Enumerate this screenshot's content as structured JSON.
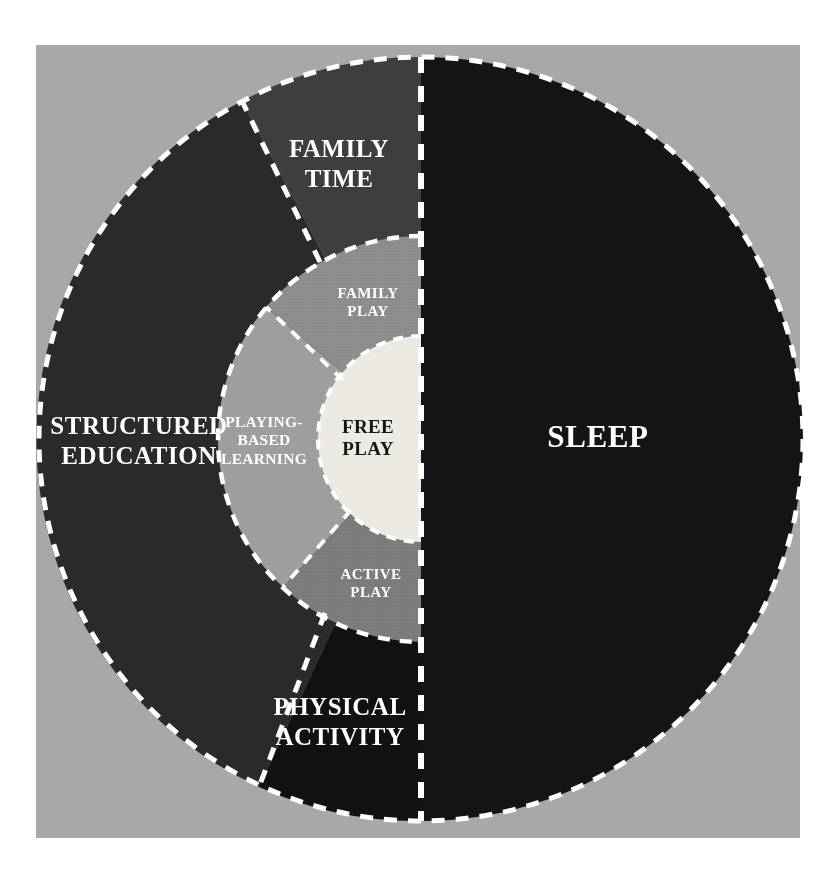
{
  "figure": {
    "type": "concentric-ring-diagram",
    "background_color": "#ffffff",
    "panel_color": "#a8a8a8",
    "divider_style": "white-dashed",
    "divider_color": "#ffffff"
  },
  "geometry": {
    "center_x": 421,
    "center_y": 439,
    "outer_radius": 382,
    "middle_radius": 203,
    "inner_radius": 103
  },
  "rings": {
    "outer": {
      "name": "outer-ring",
      "segments": [
        {
          "id": "sleep",
          "label": "SLEEP",
          "color": "#141414",
          "text_color": "#ffffff",
          "start_angle": -90,
          "end_angle": 90,
          "label_x": 598,
          "label_y": 437
        },
        {
          "id": "family-time",
          "label": "FAMILY\nTIME",
          "color": "#3e3e3e",
          "text_color": "#ffffff",
          "start_angle": -90,
          "end_angle": -62,
          "label_x": 339,
          "label_y": 163
        },
        {
          "id": "structured-education",
          "label": "STRUCTURED\nEDUCATION",
          "color": "#2a2a2a",
          "text_color": "#ffffff",
          "start_angle": -62,
          "end_angle": 115,
          "label_x": 139,
          "label_y": 440
        },
        {
          "id": "physical-activity",
          "label": "PHYSICAL\nACTIVITY",
          "color": "#111111",
          "text_color": "#ffffff",
          "start_angle": 115,
          "end_angle": 90,
          "label_x": 340,
          "label_y": 721
        }
      ]
    },
    "middle": {
      "name": "middle-ring",
      "segments": [
        {
          "id": "family-play",
          "label": "FAMILY\nPLAY",
          "color": "#8d8d8d",
          "text_color": "#ffffff",
          "start_angle": -90,
          "end_angle": -40,
          "label_x": 368,
          "label_y": 303
        },
        {
          "id": "playing-based-learning",
          "label": "PLAYING-\nBASED\nLEARNING",
          "color": "#9e9e9e",
          "text_color": "#ffffff",
          "start_angle": -40,
          "end_angle": 133,
          "label_x": 264,
          "label_y": 440
        },
        {
          "id": "active-play",
          "label": "ACTIVE\nPLAY",
          "color": "#7c7c7c",
          "text_color": "#ffffff",
          "start_angle": 133,
          "end_angle": 90,
          "label_x": 371,
          "label_y": 584
        }
      ]
    },
    "inner": {
      "name": "inner-core",
      "segments": [
        {
          "id": "free-play",
          "label": "FREE\nPLAY",
          "color": "#eceae3",
          "text_color": "#151515",
          "label_x": 368,
          "label_y": 438
        },
        {
          "id": "free-play-sleep-side",
          "label": "",
          "color": "#141414",
          "text_color": "#ffffff"
        }
      ]
    }
  },
  "legend_text": {
    "sleep": "SLEEP",
    "family_time": "FAMILY TIME",
    "structured_education": "STRUCTURED EDUCATION",
    "physical_activity": "PHYSICAL ACTIVITY",
    "family_play": "FAMILY PLAY",
    "playing_based_learning": "PLAYING-BASED LEARNING",
    "active_play": "ACTIVE PLAY",
    "free_play": "FREE PLAY"
  }
}
